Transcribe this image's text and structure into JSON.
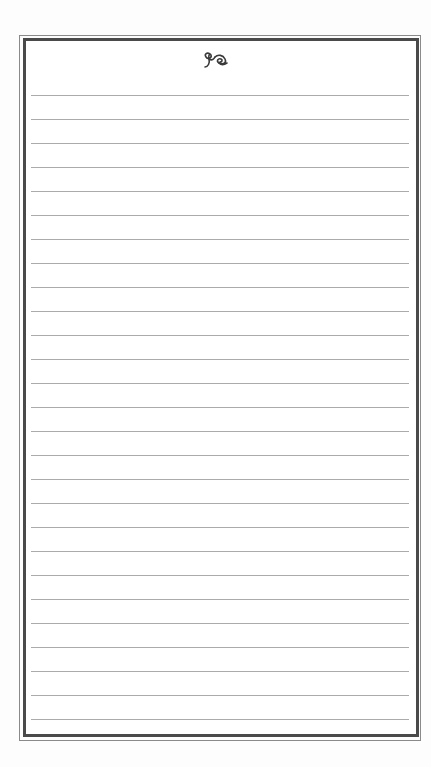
{
  "page": {
    "type": "lined-notepaper",
    "ornament": {
      "name": "calligraphic-flourish",
      "color": "#3a3a3a"
    },
    "frame": {
      "style": "double-line border",
      "outer_color": "#8a8a8a",
      "inner_color": "#4a4a4a"
    },
    "lines": {
      "count": 27,
      "first_y": 95,
      "spacing": 24,
      "color": "#ababab"
    }
  }
}
